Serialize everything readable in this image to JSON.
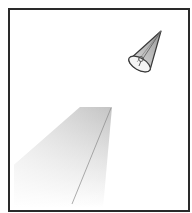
{
  "figure": {
    "colors": {
      "frame": "#2a2a2a",
      "background": "#ffffff",
      "cone_fill": "#c8c8c8",
      "cone_stroke": "#3a3a3a",
      "beam_top": "#c4c4c4",
      "beam_bottom": "#ffffff"
    },
    "cone": {
      "apex": [
        161,
        31
      ],
      "base_center": [
        140,
        63
      ],
      "base_rx": 12,
      "base_ry": 6
    },
    "beam": {
      "points": [
        [
          80,
          107
        ],
        [
          112,
          107
        ],
        [
          103,
          208
        ],
        [
          14,
          208
        ],
        [
          14,
          165
        ]
      ],
      "divider": [
        [
          110,
          110
        ],
        [
          72,
          204
        ]
      ]
    }
  }
}
